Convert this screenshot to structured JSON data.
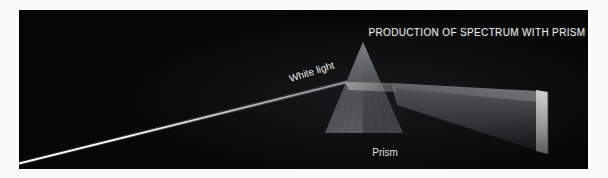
{
  "figure": {
    "title": "PRODUCTION OF SPECTRUM WITH PRISM",
    "kind": "optics-diagram-photograph",
    "background_color": "#050505",
    "mat_color": "#fbfbfb",
    "plate": {
      "x": 19,
      "y": 10,
      "width": 569,
      "height": 159
    }
  },
  "labels": {
    "white_light": "White light",
    "prism": "Prism"
  },
  "elements": {
    "incoming_beam": {
      "name": "white-light-beam",
      "color": "#ffffff",
      "start": {
        "x": 0,
        "y": 153
      },
      "end": {
        "x": 326,
        "y": 72
      },
      "thickness": 2
    },
    "prism": {
      "name": "glass-prism",
      "shape": "triangle",
      "apex": {
        "x": 344,
        "y": 32
      },
      "base_left": {
        "x": 306,
        "y": 123
      },
      "base_right": {
        "x": 384,
        "y": 123
      },
      "fill_top": "#8f9296",
      "fill_bottom": "#53565b"
    },
    "refracted_band": {
      "name": "internal-refraction-band",
      "color": "#d8d8cf"
    },
    "dispersed_beam": {
      "name": "dispersed-spectrum-beam",
      "apex": {
        "x": 372,
        "y": 73
      },
      "screen_top": {
        "x": 517,
        "y": 82
      },
      "screen_bottom": {
        "x": 529,
        "y": 143
      },
      "color_top": "#6e6f72",
      "color_bottom": "#2a2b2e"
    },
    "spectrum_band": {
      "name": "spectrum-on-screen",
      "x": 517,
      "y": 80,
      "width": 12,
      "height": 64,
      "gradient": [
        "#f2f2ee",
        "#c9c9c4",
        "#9a9a96",
        "#6d6d6a"
      ]
    }
  },
  "colors": {
    "plate_black": "#050505",
    "beam_white": "#ffffff",
    "prism_grey": "#7c7f84",
    "text_light": "#e9e9e9"
  }
}
